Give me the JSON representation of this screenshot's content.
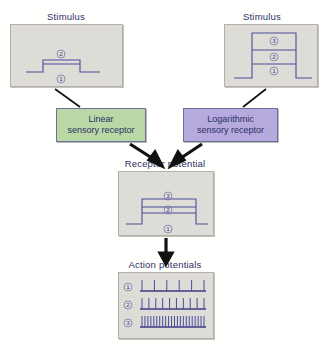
{
  "figure": {
    "background_color": "#fffffe",
    "panel_fill": "#dedcd7",
    "trace_color": "#4a4c9c",
    "text_color": "#2c2f64"
  },
  "panels": {
    "stimulus_left": {
      "caption": "Stimulus",
      "levels": [
        {
          "label": "①",
          "value": 0
        },
        {
          "label": "②",
          "value": 1
        }
      ]
    },
    "stimulus_right": {
      "caption": "Stimulus",
      "levels": [
        {
          "label": "①",
          "value": 1
        },
        {
          "label": "②",
          "value": 2
        },
        {
          "label": "③",
          "value": 3
        }
      ]
    },
    "receptor_potential": {
      "caption": "Receptor potential",
      "levels": [
        {
          "label": "①",
          "value": 0
        },
        {
          "label": "②",
          "value": 1
        },
        {
          "label": "③",
          "value": 1.6
        }
      ]
    },
    "action_potentials": {
      "caption": "Action potentials",
      "trains": [
        {
          "label": "①",
          "spike_count": 6
        },
        {
          "label": "②",
          "spike_count": 10
        },
        {
          "label": "③",
          "spike_count": 22
        }
      ]
    }
  },
  "receptors": {
    "linear": {
      "line1": "Linear",
      "line2": "sensory receptor",
      "color": "#b9d8a5"
    },
    "logarithmic": {
      "line1": "Logarithmic",
      "line2": "sensory receptor",
      "color": "#b6a9dd"
    }
  }
}
